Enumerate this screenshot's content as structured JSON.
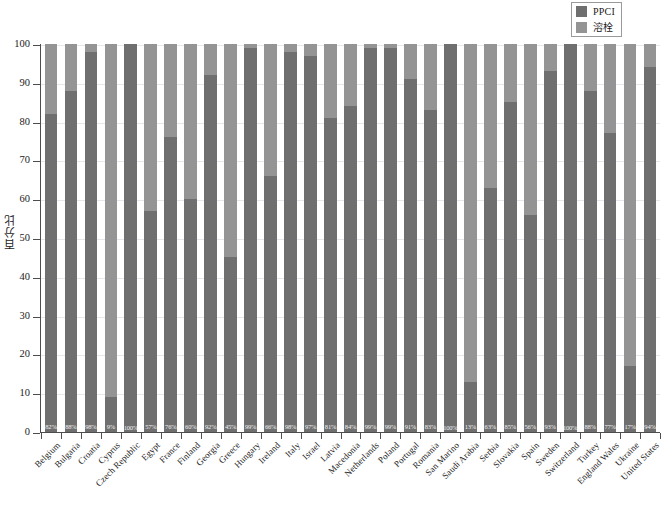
{
  "legend": {
    "items": [
      {
        "label": "PPCI",
        "color": "#6f6f6f",
        "icon": "legend-swatch-square"
      },
      {
        "label": "溶栓",
        "color": "#949494",
        "icon": "legend-swatch-square"
      }
    ]
  },
  "axes": {
    "y_title": "百分比",
    "y_ticks": [
      "0",
      "10",
      "20",
      "30",
      "40",
      "50",
      "60",
      "70",
      "80",
      "90",
      "100"
    ]
  },
  "chart_data": {
    "type": "bar",
    "title": "",
    "subtitle": "",
    "xlabel": "",
    "ylabel": "百分比",
    "ylim": [
      0,
      100
    ],
    "yticks": [
      0,
      10,
      20,
      30,
      40,
      50,
      60,
      70,
      80,
      90,
      100
    ],
    "grid": true,
    "stacked": true,
    "stack_total": 100,
    "legend_position": "top-right",
    "legend": [
      "PPCI",
      "溶栓"
    ],
    "categories": [
      "Belgium",
      "Bulgaria",
      "Croatia",
      "Cyprus",
      "Czech Republic",
      "Egypt",
      "France",
      "Finland",
      "Georgia",
      "Greece",
      "Hungary",
      "Ireland",
      "Italy",
      "Israel",
      "Latvia",
      "Macedonia",
      "Netherlands",
      "Poland",
      "Portugal",
      "Romania",
      "San Marino",
      "Saudi Arabia",
      "Serbia",
      "Slovakia",
      "Spain",
      "Sweden",
      "Switzerland",
      "Turkey",
      "England Wales",
      "Ukraine",
      "United States"
    ],
    "series": [
      {
        "name": "PPCI",
        "color": "#6f6f6f",
        "values": [
          82,
          88,
          98,
          9,
          100,
          57,
          76,
          60,
          92,
          45,
          99,
          66,
          98,
          97,
          81,
          84,
          99,
          99,
          91,
          83,
          100,
          13,
          63,
          85,
          56,
          93,
          100,
          88,
          77,
          17,
          94
        ]
      },
      {
        "name": "溶栓",
        "color": "#949494",
        "values": [
          18,
          12,
          2,
          91,
          0,
          43,
          24,
          40,
          8,
          55,
          1,
          34,
          2,
          3,
          19,
          16,
          1,
          1,
          9,
          17,
          0,
          87,
          37,
          15,
          44,
          7,
          0,
          12,
          23,
          83,
          6
        ]
      }
    ],
    "data_labels": [
      "82%",
      "88%",
      "98%",
      "9%",
      "100%",
      "57%",
      "76%",
      "60%",
      "92%",
      "45%",
      "99%",
      "66%",
      "98%",
      "97%",
      "81%",
      "84%",
      "99%",
      "99%",
      "91%",
      "83%",
      "100%",
      "13%",
      "63%",
      "85%",
      "56%",
      "93%",
      "100%",
      "88%",
      "77%",
      "17%",
      "94%"
    ],
    "data_label_series": "PPCI"
  }
}
